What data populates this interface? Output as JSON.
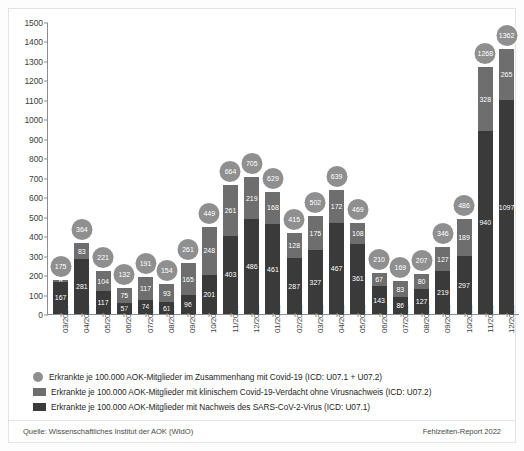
{
  "chart_data": {
    "type": "bar",
    "title": "",
    "subtitle": "",
    "xlabel": "",
    "ylabel": "",
    "ylim": [
      0,
      1500
    ],
    "ytick_step": 100,
    "yticks": [
      0,
      100,
      200,
      300,
      400,
      500,
      600,
      700,
      800,
      900,
      1000,
      1100,
      1200,
      1300,
      1400,
      1500
    ],
    "grid": false,
    "stacked": true,
    "legend_position": "bottom",
    "categories": [
      "03/2020",
      "04/2020",
      "05/2020",
      "06/2020",
      "07/2020",
      "08/2020",
      "09/2020",
      "10/2020",
      "11/2020",
      "12/2020",
      "01/2021",
      "02/2021",
      "03/2021",
      "04/2021",
      "05/2021",
      "06/2021",
      "07/2021",
      "08/2021",
      "09/2021",
      "10/2021",
      "11/2021",
      "12/2021"
    ],
    "series": [
      {
        "name": "Erkrankte je 100.000 AOK-Mitglieder mit Nachweis des SARS-CoV-2-Virus (ICD: U07.1)",
        "color": "#3a3a3a",
        "values": [
          167,
          281,
          117,
          57,
          74,
          61,
          96,
          201,
          403,
          486,
          461,
          287,
          327,
          467,
          361,
          143,
          86,
          127,
          219,
          297,
          940,
          1097
        ]
      },
      {
        "name": "Erkrankte je 100.000 AOK-Mitglieder mit klinischem Covid-19-Verdacht ohne Virusnachweis (ICD: U07.2)",
        "color": "#6e6e6e",
        "values": [
          8,
          83,
          104,
          75,
          117,
          93,
          165,
          248,
          261,
          219,
          168,
          128,
          175,
          172,
          108,
          67,
          83,
          80,
          127,
          189,
          328,
          265
        ]
      }
    ],
    "totals": {
      "name": "Erkrankte je 100.000 AOK-Mitglieder im Zusammenhang mit Covid-19 (ICD: U07.1 + U07.2)",
      "color": "#8f8f8f",
      "values": [
        175,
        364,
        221,
        132,
        191,
        154,
        261,
        449,
        664,
        705,
        629,
        415,
        502,
        639,
        469,
        210,
        169,
        207,
        346,
        486,
        1268,
        1362
      ]
    }
  },
  "legend": {
    "items": [
      {
        "marker": "circle",
        "label": "Erkrankte je 100.000 AOK-Mitglieder im Zusammenhang mit Covid-19 (ICD: U07.1 + U07.2)"
      },
      {
        "marker": "rect-mid",
        "label": "Erkrankte je 100.000 AOK-Mitglieder mit klinischem Covid-19-Verdacht ohne Virusnachweis (ICD: U07.2)"
      },
      {
        "marker": "rect-dark",
        "label": "Erkrankte je 100.000 AOK-Mitglieder mit Nachweis des SARS-CoV-2-Virus (ICD: U07.1)"
      }
    ]
  },
  "footer": {
    "source": "Quelle: Wissenschaftliches Institut der AOK (WIdO)",
    "report": "Fehlzeiten-Report 2022"
  },
  "colors": {
    "total_bubble": "#8f8f8f",
    "segment_mid": "#6e6e6e",
    "segment_dark": "#3a3a3a",
    "axis": "#8d8d8d",
    "text": "#1f1f1f"
  }
}
